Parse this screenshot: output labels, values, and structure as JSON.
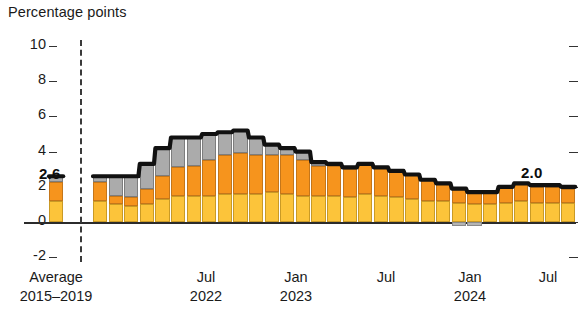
{
  "chart_data": {
    "type": "bar",
    "subtype": "stacked-bar-with-total-line",
    "title": "Percentage points",
    "xlabel": "",
    "ylabel": "Percentage points",
    "ylim": [
      -2,
      10
    ],
    "yticks": [
      10,
      8,
      6,
      4,
      2,
      0,
      -2
    ],
    "grid": false,
    "legend": "none",
    "series": [
      {
        "name": "yellow",
        "color": "#fcc43a",
        "values": [
          1.2,
          1.0,
          0.9,
          1.0,
          1.3,
          1.5,
          1.5,
          1.5,
          1.6,
          1.6,
          1.6,
          1.7,
          1.6,
          1.5,
          1.5,
          1.5,
          1.4,
          1.6,
          1.5,
          1.4,
          1.3,
          1.2,
          1.2,
          1.1,
          1.0,
          1.0,
          1.1,
          1.2,
          1.1,
          1.1,
          1.1
        ]
      },
      {
        "name": "orange",
        "color": "#f6941d",
        "values": [
          1.1,
          0.5,
          0.5,
          0.9,
          1.3,
          1.6,
          1.7,
          2.0,
          2.2,
          2.3,
          2.2,
          2.1,
          2.2,
          2.0,
          1.7,
          1.7,
          1.6,
          1.7,
          1.6,
          1.5,
          1.4,
          1.2,
          1.0,
          0.8,
          0.7,
          0.7,
          0.9,
          1.0,
          0.9,
          0.9,
          0.8
        ]
      },
      {
        "name": "gray",
        "color": "#ababab",
        "values": [
          0.3,
          1.1,
          1.2,
          1.4,
          1.6,
          1.7,
          1.6,
          1.5,
          1.3,
          1.3,
          1.0,
          0.6,
          0.4,
          0.5,
          0.2,
          0.1,
          0.1,
          0.0,
          0.0,
          0.0,
          0.0,
          0.0,
          0.0,
          -0.2,
          -0.2,
          0.0,
          0.0,
          0.0,
          0.1,
          0.1,
          0.1
        ]
      }
    ],
    "totals": [
      2.6,
      2.6,
      2.6,
      3.3,
      4.2,
      4.8,
      4.8,
      5.0,
      5.1,
      5.2,
      4.8,
      4.4,
      4.2,
      4.0,
      3.4,
      3.3,
      3.1,
      3.3,
      3.1,
      2.9,
      2.7,
      2.4,
      2.2,
      1.9,
      1.7,
      1.7,
      2.0,
      2.2,
      2.1,
      2.1,
      2.0
    ],
    "average_bar": {
      "label": "2.6",
      "total": 2.6,
      "yellow": 1.2,
      "orange": 1.1,
      "gray": 0.3
    },
    "endpoint_label": "2.0",
    "xticks": [
      {
        "label_top": "Average",
        "label_bottom": "2015–2019"
      },
      {
        "label_top": "Jul",
        "label_bottom": "2022"
      },
      {
        "label_top": "Jan",
        "label_bottom": "2023"
      },
      {
        "label_top": "Jul",
        "label_bottom": ""
      },
      {
        "label_top": "Jan",
        "label_bottom": "2024"
      },
      {
        "label_top": "Jul",
        "label_bottom": ""
      }
    ],
    "colors": {
      "yellow": "#fcc43a",
      "orange": "#f6941d",
      "gray": "#ababab",
      "total_line": "#111111",
      "axis": "#2b2b2b"
    }
  }
}
